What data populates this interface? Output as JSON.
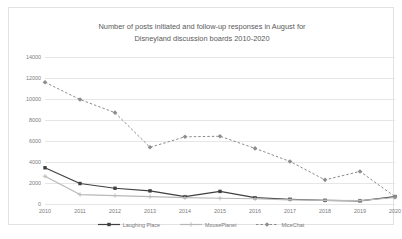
{
  "chart_data": {
    "type": "line",
    "title": "Number of posts initiated and follow-up responses in August for Disneyland discussion boards 2010-2020",
    "title_line1": "Number of posts initiated and follow-up responses in August for",
    "title_line2": "Disneyland discussion boards 2010-2020",
    "xlabel": "",
    "ylabel": "",
    "categories": [
      "2010",
      "2011",
      "2012",
      "2013",
      "2014",
      "2015",
      "2016",
      "2017",
      "2018",
      "2019",
      "2020"
    ],
    "x": [
      2010,
      2011,
      2012,
      2013,
      2014,
      2015,
      2016,
      2017,
      2018,
      2019,
      2020
    ],
    "ylim": [
      0,
      14000
    ],
    "yticks": [
      0,
      2000,
      4000,
      6000,
      8000,
      10000,
      12000,
      14000
    ],
    "ytick_labels": [
      "0",
      "2000",
      "4000",
      "6000",
      "8000",
      "10000",
      "12000",
      "14000"
    ],
    "grid": true,
    "legend_position": "bottom",
    "series": [
      {
        "name": "Laughing Place",
        "color": "#404040",
        "style": "solid",
        "marker": "square",
        "values": [
          3450,
          1950,
          1500,
          1250,
          700,
          1200,
          600,
          450,
          350,
          300,
          700
        ]
      },
      {
        "name": "MousePlanet",
        "color": "#b8b8b8",
        "style": "solid",
        "marker": "cross",
        "values": [
          2650,
          900,
          800,
          700,
          600,
          550,
          500,
          400,
          350,
          320,
          620
        ]
      },
      {
        "name": "MiceChat",
        "color": "#8c8c8c",
        "style": "dashed",
        "marker": "diamond",
        "values": [
          11600,
          9950,
          8700,
          5400,
          6400,
          6450,
          5300,
          4050,
          2300,
          3100,
          700
        ]
      }
    ]
  }
}
